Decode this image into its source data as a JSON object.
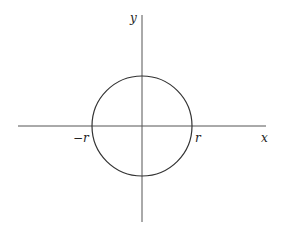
{
  "diagram": {
    "axes": {
      "x_label": "x",
      "y_label": "y"
    },
    "intercepts": {
      "negative": "−r",
      "positive": "r"
    },
    "colors": {
      "stroke": "#333333",
      "axis": "#555555",
      "background": "#ffffff"
    }
  }
}
